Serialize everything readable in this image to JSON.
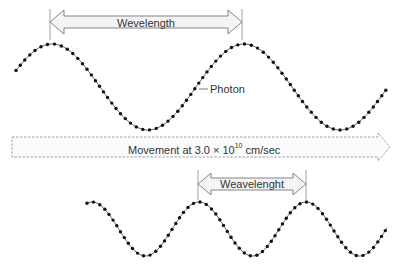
{
  "diagram": {
    "top_wave": {
      "label": "Wevelength",
      "photon_label": "Photon",
      "x_start": 16,
      "x_end": 386,
      "center_y": 87,
      "amplitude": 43,
      "period": 192,
      "peak_x": 52
    },
    "movement": {
      "label_prefix": "Movement at 3.0 × 10",
      "label_exponent": "10",
      "label_suffix": "cm/sec"
    },
    "bottom_wave": {
      "label": "Weavelenght",
      "x_start": 87,
      "x_end": 387,
      "center_y": 229,
      "amplitude": 27,
      "period": 107,
      "peak_x": 199
    },
    "colors": {
      "wave": "#555555",
      "dot": "#111111",
      "arrow_stroke": "#777777",
      "arrow_fill": "#f4f4f4",
      "text": "#333333"
    }
  }
}
